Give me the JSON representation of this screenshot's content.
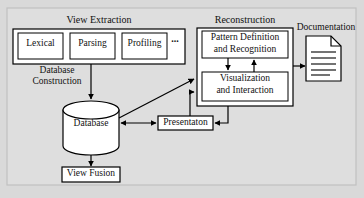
{
  "figure": {
    "background_color": "#d9d9d9",
    "frame_color": "#c8c8c8",
    "box_fill": "#ffffff",
    "stroke_color": "#000000"
  },
  "groups": {
    "view_extraction": {
      "label": "View Extraction",
      "items": [
        {
          "label": "Lexical"
        },
        {
          "label": "Parsing"
        },
        {
          "label": "Profiling"
        }
      ],
      "ellipsis": "..."
    },
    "reconstruction": {
      "label": "Reconstruction",
      "items": [
        {
          "label_line1": "Pattern Definition",
          "label_line2": "and Recognition"
        },
        {
          "label_line1": "Visualization",
          "label_line2": "and Interaction"
        }
      ]
    }
  },
  "nodes": {
    "database": {
      "label": "Database"
    },
    "view_fusion": {
      "label": "View Fusion"
    },
    "presentation": {
      "label": "Presentaton"
    },
    "documentation": {
      "label": "Documentation",
      "icon": "document-page-icon",
      "line_count": 5
    }
  },
  "edge_labels": {
    "database_construction_line1": "Database",
    "database_construction_line2": "Construction"
  }
}
